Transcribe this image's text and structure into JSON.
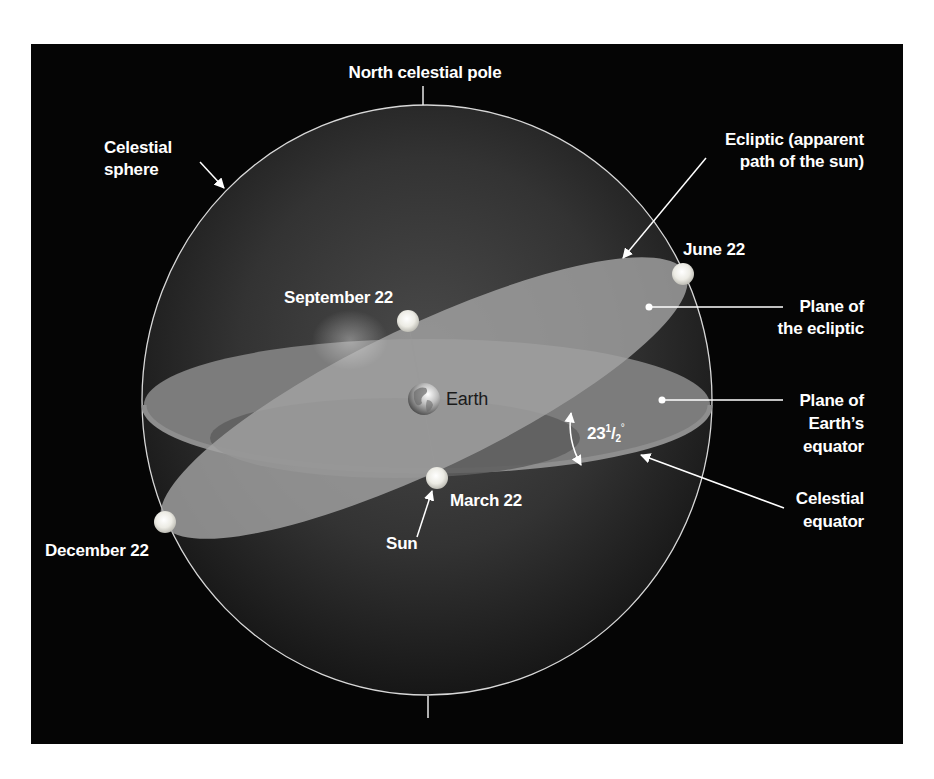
{
  "diagram": {
    "colors": {
      "background_panel": "#050505",
      "sphere_fill": "#3a3a3a",
      "sphere_outline": "#d8d8d8",
      "ecliptic_plane": "#a2a2a2",
      "equator_plane": "#7c7c7c",
      "equator_underside": "#5e5e5e",
      "sun": "#f2f2ec",
      "label_text": "#ffffff"
    },
    "labels": {
      "north_celestial_pole": "North celestial pole",
      "celestial_sphere_line1": "Celestial",
      "celestial_sphere_line2": "sphere",
      "ecliptic_line1": "Ecliptic (apparent",
      "ecliptic_line2": "path of the sun)",
      "june": "June 22",
      "september": "September 22",
      "december": "December 22",
      "march": "March 22",
      "sun": "Sun",
      "earth": "Earth",
      "plane_ecliptic_line1": "Plane of",
      "plane_ecliptic_line2": "the ecliptic",
      "plane_equator_line1": "Plane of",
      "plane_equator_line2": "Earth’s",
      "plane_equator_line3": "equator",
      "celestial_equator_line1": "Celestial",
      "celestial_equator_line2": "equator",
      "angle_whole": "23",
      "angle_num": "1",
      "angle_slash": "/",
      "angle_den": "2",
      "angle_deg": "°"
    },
    "sun_positions": [
      {
        "name": "June 22",
        "x": 683,
        "y": 274
      },
      {
        "name": "September 22",
        "x": 408,
        "y": 321
      },
      {
        "name": "December 22",
        "x": 165,
        "y": 522
      },
      {
        "name": "March 22",
        "x": 437,
        "y": 478
      }
    ],
    "obliquity_degrees": "23 1/2"
  }
}
